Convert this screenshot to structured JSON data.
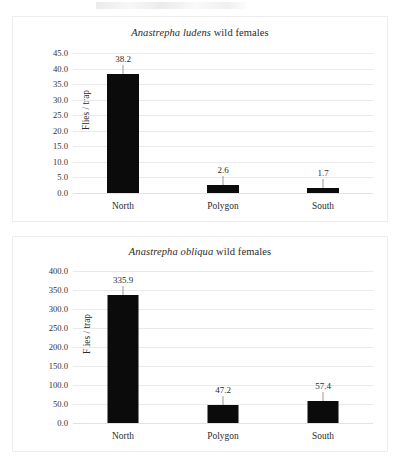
{
  "document": {
    "figure_caption": ""
  },
  "chart_data": [
    {
      "id": "chart-1",
      "type": "bar",
      "title": "Anastrepha ludens wild females",
      "title_italic_part": "Anastrepha ludens",
      "title_roman_part": " wild females",
      "xlabel": "",
      "ylabel": "Flies / trap",
      "categories": [
        "North",
        "Polygon",
        "South"
      ],
      "values": [
        38.2,
        2.6,
        1.7
      ],
      "value_labels": [
        "38.2",
        "2.6",
        "1.7"
      ],
      "ylim": [
        0.0,
        45.0
      ],
      "ytick_step": 5.0,
      "yticks": [
        "45.0",
        "40.0",
        "35.0",
        "30.0",
        "25.0",
        "20.0",
        "15.0",
        "10.0",
        "5.0",
        "0.0"
      ],
      "ytick_values": [
        45.0,
        40.0,
        35.0,
        30.0,
        25.0,
        20.0,
        15.0,
        10.0,
        5.0,
        0.0
      ],
      "grid": true,
      "legend": false,
      "bar_color": "#0b0b0b",
      "grid_color": "#eaeaea"
    },
    {
      "id": "chart-2",
      "type": "bar",
      "title": "Anastrepha obliqua wild females",
      "title_italic_part": "Anastrepha obliqua",
      "title_roman_part": " wild females",
      "xlabel": "",
      "ylabel": "Flies / trap",
      "categories": [
        "North",
        "Polygon",
        "South"
      ],
      "values": [
        335.9,
        47.2,
        57.4
      ],
      "value_labels": [
        "335.9",
        "47.2",
        "57.4"
      ],
      "ylim": [
        0.0,
        400.0
      ],
      "ytick_step": 50.0,
      "yticks": [
        "400.0",
        "350.0",
        "300.0",
        "250.0",
        "200.0",
        "150.0",
        "100.0",
        "50.0",
        "0.0"
      ],
      "ytick_values": [
        400.0,
        350.0,
        300.0,
        250.0,
        200.0,
        150.0,
        100.0,
        50.0,
        0.0
      ],
      "grid": true,
      "legend": false,
      "bar_color": "#0b0b0b",
      "grid_color": "#eaeaea"
    }
  ]
}
